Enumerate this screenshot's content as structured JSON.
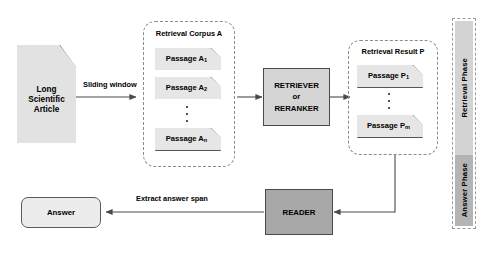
{
  "diagram": {
    "source_document": {
      "label": "Long\nScientific\nArticle",
      "line1": "Long",
      "line2": "Scientific",
      "line3": "Article",
      "shape": "document-icon",
      "fill": "#e2e2e2"
    },
    "edges": [
      {
        "name": "sliding-window",
        "label": "Sliding window",
        "from": "article",
        "to": "retrieval-corpus"
      },
      {
        "name": "corpus-to-retriever",
        "label": "",
        "from": "retrieval-corpus",
        "to": "retriever"
      },
      {
        "name": "retriever-to-result",
        "label": "",
        "from": "retriever",
        "to": "retrieval-result"
      },
      {
        "name": "result-to-reader",
        "label": "",
        "from": "retrieval-result",
        "to": "reader"
      },
      {
        "name": "reader-to-answer",
        "label": "Extract answer span",
        "from": "reader",
        "to": "answer"
      }
    ],
    "groups": [
      {
        "name": "retrieval-corpus",
        "title": "Retrieval Corpus A",
        "items": [
          {
            "base": "Passage A",
            "sub": "1"
          },
          {
            "base": "Passage A",
            "sub": "2"
          },
          {
            "ellipsis": true
          },
          {
            "base": "Passage A",
            "sub": "n"
          }
        ]
      },
      {
        "name": "retrieval-result",
        "title": "Retrieval Result P",
        "items": [
          {
            "base": "Passage P",
            "sub": "1"
          },
          {
            "ellipsis": true
          },
          {
            "base": "Passage P",
            "sub": "m"
          }
        ]
      }
    ],
    "process_boxes": [
      {
        "name": "retriever",
        "line1": "RETRIEVER",
        "line2": "or",
        "line3": "RERANKER",
        "fill": "#d5d5d5"
      },
      {
        "name": "reader",
        "label": "READER",
        "fill": "#a8a8a8"
      }
    ],
    "answer": {
      "name": "answer",
      "label": "Answer",
      "fill": "#ececec"
    },
    "phases": [
      {
        "name": "retrieval-phase",
        "label": "Retrieval Phase",
        "fill": "#d3d3d3"
      },
      {
        "name": "answer-phase",
        "label": "Answer Phase",
        "fill": "#b4b4b4"
      }
    ],
    "colors": {
      "stroke": "#555555",
      "dashed_stroke": "#8a8a8a",
      "doc_fill": "#e6e6e6",
      "retriever_fill": "#d5d5d5",
      "reader_fill": "#a8a8a8",
      "answer_fill": "#ececec",
      "phase_retrieval_fill": "#d3d3d3",
      "phase_answer_fill": "#b4b4b4"
    }
  }
}
